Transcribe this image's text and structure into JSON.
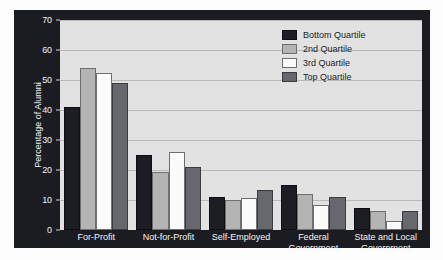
{
  "chart_data": {
    "type": "bar",
    "title": "",
    "xlabel": "",
    "ylabel": "Percentage of Alumni",
    "ylim": [
      0,
      70
    ],
    "ytick_values": [
      0,
      10,
      20,
      30,
      40,
      50,
      60,
      70
    ],
    "ytick_labels": [
      "0",
      "10",
      "20",
      "30",
      "40",
      "50",
      "60",
      "70"
    ],
    "grid": true,
    "legend_position": "top-right",
    "categories": [
      "For-Profit",
      "Not-for-Profit",
      "Self-Employed",
      "Federal\nGovernment",
      "State and Local\nGovernment"
    ],
    "series": [
      {
        "name": "Bottom Quartile",
        "color": "#1d1d24",
        "values": [
          41,
          25,
          11,
          15,
          7.5
        ]
      },
      {
        "name": "2nd Quartile",
        "color": "#b4b4b4",
        "values": [
          54,
          19.5,
          10,
          12,
          6.5
        ]
      },
      {
        "name": "3rd Quartile",
        "color": "#fbfbfb",
        "values": [
          52.5,
          26,
          10.7,
          8.5,
          3
        ]
      },
      {
        "name": "Top Quartile",
        "color": "#67676e",
        "values": [
          49,
          21,
          13.5,
          11,
          6.2
        ]
      }
    ]
  },
  "colors": {
    "frame": "#1b1b22",
    "plot_background": "#e2e2e2",
    "gridline": "#b9b9b9",
    "axis_text": "#f2f2f2",
    "legend_text": "#1c1c1c"
  }
}
